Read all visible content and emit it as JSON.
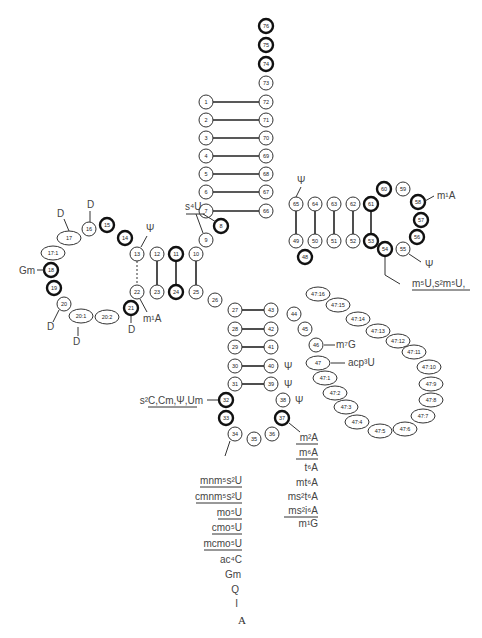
{
  "figure": {
    "caption": "A",
    "acceptor_stem": [
      "1",
      "2",
      "3",
      "4",
      "5",
      "6",
      "7",
      "66",
      "67",
      "68",
      "69",
      "70",
      "71",
      "72",
      "73",
      "74",
      "75",
      "76"
    ],
    "modified_highlight": [
      "74",
      "75",
      "76",
      "8",
      "14",
      "15",
      "18",
      "19",
      "21",
      "24",
      "32",
      "33",
      "37",
      "48",
      "53",
      "54",
      "56",
      "57",
      "58",
      "60",
      "61"
    ],
    "labels": {
      "s4u": "s⁴U",
      "d16": "D",
      "d17": "D",
      "gm18": "Gm",
      "psi13": "Ψ",
      "m1a22": "m¹A",
      "d20": "D",
      "d20a": "D",
      "d21": "D",
      "psi55_top": "Ψ",
      "m1a58": "m¹A",
      "psi55": "Ψ",
      "m5u54": "m⁵U,s²m⁵U,",
      "m7g46": "m⁷G",
      "acp3u47": "acp³U",
      "psi40": "Ψ",
      "psi39": "Ψ",
      "psi38": "Ψ",
      "s2c32": "s²C,Cm,Ψ,Um",
      "pos34_list": [
        "mnm⁵s²U",
        "cmnm⁵s²U",
        "mo⁵U",
        "cmo⁵U",
        "mcmo⁵U",
        "ac⁴C",
        "Gm",
        "Q",
        "I"
      ],
      "pos37_list": [
        "m²A",
        "m⁶A",
        "t⁶A",
        "mt⁶A",
        "ms²t⁶A",
        "ms²i⁶A",
        "m¹G"
      ]
    }
  }
}
